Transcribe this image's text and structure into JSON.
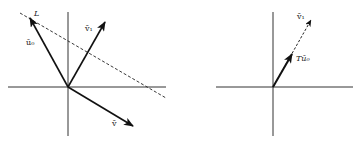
{
  "colors": {
    "stroke": "#111111",
    "background": "#ffffff",
    "label": "#222222"
  },
  "left_panel": {
    "origin": [
      68,
      87
    ],
    "axes": {
      "horizontal": [
        8,
        166
      ],
      "vertical": [
        12,
        136
      ]
    },
    "line_L": {
      "label": "L",
      "from": [
        20,
        13
      ],
      "to": [
        166,
        98
      ],
      "style": "dashed"
    },
    "vectors": [
      {
        "name": "u0",
        "label": "ū₀",
        "to": [
          30,
          18
        ],
        "style": "solid"
      },
      {
        "name": "v1",
        "label": "v̄₁",
        "to": [
          105,
          22
        ],
        "style": "solid"
      },
      {
        "name": "v",
        "label": "v̄",
        "to": [
          133,
          126
        ],
        "style": "solid"
      }
    ]
  },
  "right_panel": {
    "origin": [
      273,
      87
    ],
    "axes": {
      "horizontal": [
        216,
        353
      ],
      "vertical": [
        12,
        136
      ]
    },
    "vectors": [
      {
        "name": "v1",
        "label": "v̄₁",
        "to": [
          311,
          20
        ],
        "style": "dashed"
      },
      {
        "name": "Tu0",
        "label": "Tū₀",
        "to": [
          292,
          55
        ],
        "style": "solid-bold"
      }
    ]
  }
}
